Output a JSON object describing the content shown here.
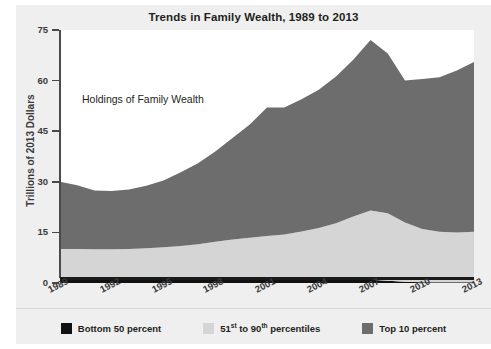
{
  "page": {
    "clipped_top_text": "",
    "background": "#efefef"
  },
  "chart_data": {
    "type": "area",
    "title": "Trends in Family Wealth, 1989 to 2013",
    "annotation": "Holdings of Family Wealth",
    "xlabel": "",
    "ylabel": "Trillions of 2013 Dollars",
    "stacked": true,
    "grid": false,
    "legend_position": "bottom",
    "ylim": [
      0,
      75
    ],
    "yticks": [
      0,
      15,
      30,
      45,
      60,
      75
    ],
    "xticks": [
      "1989",
      "1992",
      "1995",
      "1998",
      "2001",
      "2004",
      "2007",
      "2010",
      "2013"
    ],
    "x": [
      1989,
      1990,
      1991,
      1992,
      1993,
      1994,
      1995,
      1996,
      1997,
      1998,
      1999,
      2000,
      2001,
      2002,
      2003,
      2004,
      2005,
      2006,
      2007,
      2008,
      2009,
      2010,
      2011,
      2012,
      2013
    ],
    "series": [
      {
        "name": "Bottom 50 percent",
        "color": "#111111",
        "values": [
          0.9,
          0.9,
          0.9,
          0.9,
          0.9,
          0.9,
          1.0,
          1.0,
          1.0,
          1.0,
          1.1,
          1.1,
          1.1,
          1.1,
          1.1,
          1.1,
          1.1,
          1.1,
          1.0,
          0.7,
          0.4,
          0.2,
          0.2,
          0.2,
          0.2
        ]
      },
      {
        "name": "51st to 90th percentiles",
        "color": "#d5d5d5",
        "values": [
          9.2,
          9.2,
          9.1,
          9.1,
          9.2,
          9.4,
          9.6,
          10.0,
          10.5,
          11.2,
          11.8,
          12.3,
          12.8,
          13.3,
          14.2,
          15.2,
          16.6,
          18.6,
          20.5,
          20.0,
          17.5,
          15.8,
          15.0,
          14.8,
          15.0
        ]
      },
      {
        "name": "Top 10 percent",
        "color": "#6d6d6d",
        "values": [
          19.9,
          18.9,
          17.4,
          17.3,
          17.6,
          18.5,
          19.8,
          21.8,
          24.0,
          26.8,
          30.1,
          33.6,
          38.1,
          37.6,
          39.2,
          41.0,
          43.5,
          46.5,
          50.5,
          47.3,
          42.1,
          44.5,
          45.8,
          48.0,
          50.3
        ]
      }
    ],
    "totals": [
      30.0,
      29.0,
      27.4,
      27.3,
      27.7,
      28.8,
      30.4,
      32.8,
      35.5,
      39.0,
      43.0,
      47.0,
      52.0,
      52.0,
      54.5,
      57.3,
      61.2,
      66.2,
      72.0,
      68.0,
      60.0,
      60.5,
      61.0,
      63.0,
      65.5
    ]
  },
  "legend": {
    "items": [
      {
        "label": "Bottom 50 percent",
        "label_pre": "Bottom 50 percent",
        "sup1": "",
        "label_mid": "",
        "sup2": "",
        "label_post": "",
        "color": "#111111"
      },
      {
        "label": "51st to 90th percentiles",
        "label_pre": "51",
        "sup1": "st",
        "label_mid": " to 90",
        "sup2": "th",
        "label_post": " percentiles",
        "color": "#d5d5d5"
      },
      {
        "label": "Top 10 percent",
        "label_pre": "Top 10 percent",
        "sup1": "",
        "label_mid": "",
        "sup2": "",
        "label_post": "",
        "color": "#6d6d6d"
      }
    ]
  }
}
